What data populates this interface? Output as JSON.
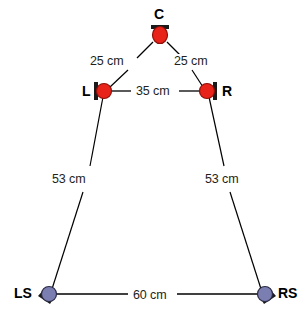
{
  "diagram": {
    "type": "speaker-placement-diagram",
    "units": "cm",
    "colors": {
      "front_speaker_fill": "#e8231a",
      "front_speaker_stroke": "#8e1008",
      "surround_speaker_fill": "#7a7eb0",
      "surround_speaker_stroke": "#2b2b45",
      "bracket": "#1a1a1a",
      "line": "#000000",
      "text": "#231f20",
      "background": "#ffffff"
    },
    "speakers": [
      {
        "id": "C",
        "label": "C",
        "x": 160,
        "y": 35,
        "kind": "front",
        "label_x": 154,
        "label_y": 7,
        "bracket": "top"
      },
      {
        "id": "L",
        "label": "L",
        "x": 104,
        "y": 91,
        "kind": "front",
        "label_x": 82,
        "label_y": 84,
        "bracket": "left"
      },
      {
        "id": "R",
        "label": "R",
        "x": 207,
        "y": 91,
        "kind": "front",
        "label_x": 222,
        "label_y": 84,
        "bracket": "right"
      },
      {
        "id": "LS",
        "label": "LS",
        "x": 48,
        "y": 294,
        "kind": "surround",
        "label_x": 14,
        "label_y": 286,
        "bracket": "wedge-left"
      },
      {
        "id": "RS",
        "label": "RS",
        "x": 265,
        "y": 294,
        "kind": "surround",
        "label_x": 278,
        "label_y": 286,
        "bracket": "wedge-right"
      }
    ],
    "measurements": [
      {
        "id": "c-to-l",
        "from": "C",
        "to": "L",
        "value": "25 cm",
        "label_x": 88,
        "label_y": 54
      },
      {
        "id": "c-to-r",
        "from": "C",
        "to": "R",
        "value": "25 cm",
        "label_x": 172,
        "label_y": 54
      },
      {
        "id": "l-to-r",
        "from": "L",
        "to": "R",
        "value": "35 cm",
        "label_x": 134,
        "label_y": 84
      },
      {
        "id": "l-to-ls",
        "from": "L",
        "to": "LS",
        "value": "53 cm",
        "label_x": 50,
        "label_y": 172
      },
      {
        "id": "r-to-rs",
        "from": "R",
        "to": "RS",
        "value": "53 cm",
        "label_x": 203,
        "label_y": 172
      },
      {
        "id": "ls-to-rs",
        "from": "LS",
        "to": "RS",
        "value": "60 cm",
        "label_x": 131,
        "label_y": 288
      }
    ]
  }
}
